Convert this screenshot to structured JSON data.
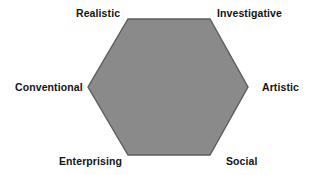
{
  "figure": {
    "name": "Holland RIASEC hexagon",
    "background_color": "#ffffff"
  },
  "chart_data": {
    "type": "diagram",
    "shape": "hexagon",
    "title": "",
    "fill_color": "#8a8a8a",
    "stroke_color": "#5e5e5e",
    "label_color": "#141414",
    "vertices": [
      {
        "key": "realistic",
        "label": "Realistic",
        "position": "top-left",
        "x": 128,
        "y": 19
      },
      {
        "key": "investigative",
        "label": "Investigative",
        "position": "top-right",
        "x": 210,
        "y": 19
      },
      {
        "key": "artistic",
        "label": "Artistic",
        "position": "right",
        "x": 248,
        "y": 87
      },
      {
        "key": "social",
        "label": "Social",
        "position": "bottom-right",
        "x": 210,
        "y": 155
      },
      {
        "key": "enterprising",
        "label": "Enterprising",
        "position": "bottom-left",
        "x": 128,
        "y": 155
      },
      {
        "key": "conventional",
        "label": "Conventional",
        "position": "left",
        "x": 88,
        "y": 87
      }
    ],
    "polygon_points": "128,19 210,19 248,87 210,155 128,155 88,87"
  },
  "labels": {
    "realistic": "Realistic",
    "investigative": "Investigative",
    "conventional": "Conventional",
    "artistic": "Artistic",
    "enterprising": "Enterprising",
    "social": "Social"
  }
}
